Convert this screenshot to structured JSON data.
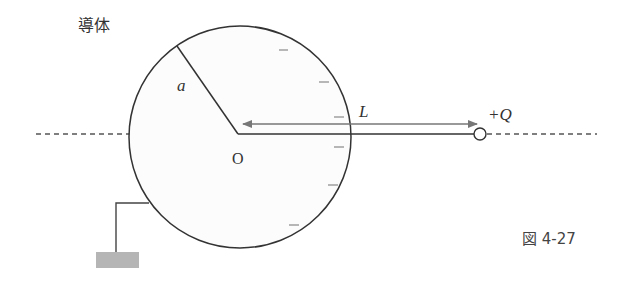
{
  "figure": {
    "title": "導体",
    "caption": "図 4-27",
    "labels": {
      "radius": "a",
      "center": "O",
      "distance": "L",
      "charge": "+Q"
    },
    "induced_charge_sign": "−",
    "induced_charge_count": 6,
    "colors": {
      "stroke": "#333333",
      "arrow": "#777777",
      "ground": "#b5b5b5",
      "conductor_fill": "#fcfcfc",
      "dash": "#555555"
    }
  }
}
